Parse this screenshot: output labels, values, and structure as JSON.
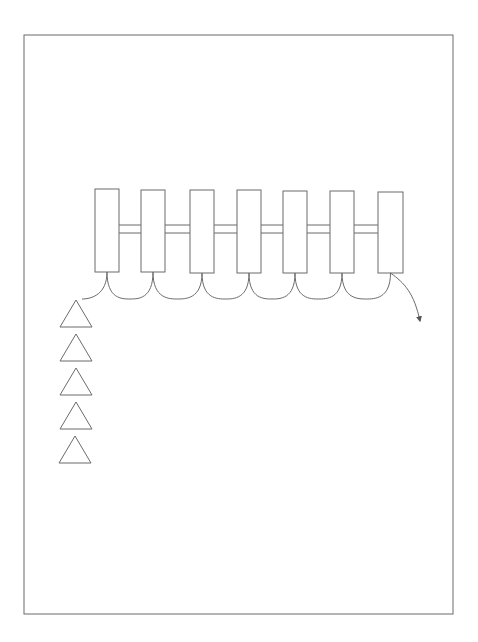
{
  "canvas": {
    "width": 478,
    "height": 642,
    "background": "#ffffff"
  },
  "colors": {
    "stroke": "#6b6b6b",
    "fill": "#ffffff"
  },
  "frame": {
    "x": 24,
    "y": 35,
    "width": 429,
    "height": 579
  },
  "rectangles": [
    {
      "x": 95,
      "y": 189,
      "width": 24,
      "height": 83
    },
    {
      "x": 141,
      "y": 190,
      "width": 24,
      "height": 82
    },
    {
      "x": 190,
      "y": 190,
      "width": 24,
      "height": 83
    },
    {
      "x": 237,
      "y": 190,
      "width": 24,
      "height": 83
    },
    {
      "x": 283,
      "y": 191,
      "width": 24,
      "height": 82
    },
    {
      "x": 330,
      "y": 191,
      "width": 24,
      "height": 82
    },
    {
      "x": 378,
      "y": 192,
      "width": 25,
      "height": 81
    }
  ],
  "connector_bars": {
    "top_y": 225,
    "bottom_y": 233
  },
  "arc_bottom_y": 299,
  "first_arc_end": {
    "x": 82,
    "y": 299
  },
  "exit_arrow": {
    "end": {
      "x": 420,
      "y": 321
    }
  },
  "triangles": [
    {
      "apex_x": 76,
      "apex_y": 300,
      "half_base": 16,
      "height": 27
    },
    {
      "apex_x": 76,
      "apex_y": 334,
      "half_base": 16,
      "height": 27
    },
    {
      "apex_x": 76,
      "apex_y": 368,
      "half_base": 16,
      "height": 27
    },
    {
      "apex_x": 76,
      "apex_y": 402,
      "half_base": 16,
      "height": 27
    },
    {
      "apex_x": 75,
      "apex_y": 436,
      "half_base": 16,
      "height": 27
    }
  ]
}
